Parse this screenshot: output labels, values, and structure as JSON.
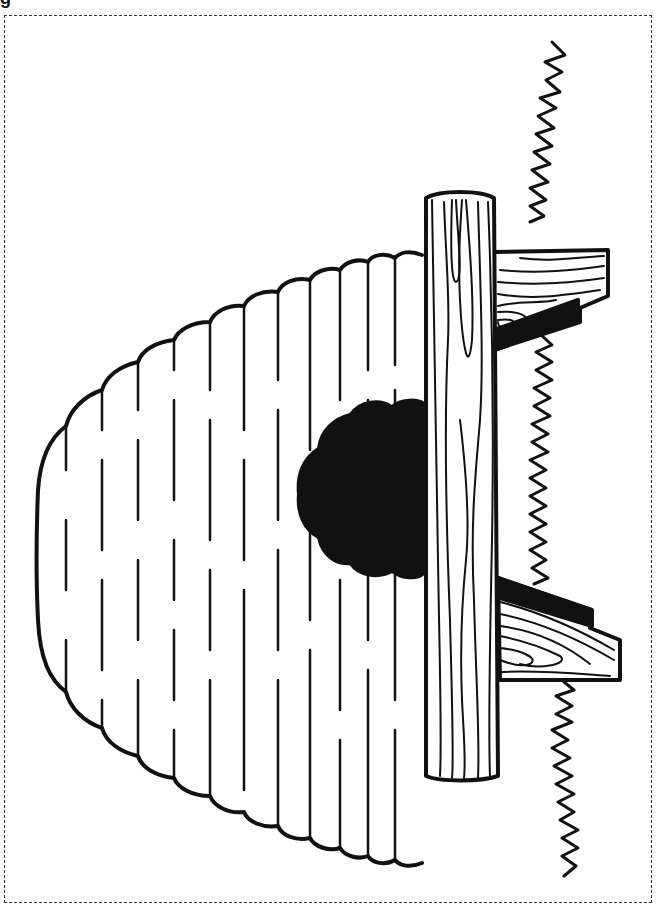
{
  "page": {
    "type": "coloring-page",
    "top_fragment_text": "g",
    "colors": {
      "line": "#111111",
      "fill": "#ffffff",
      "entrance": "#111111",
      "border": "#333333"
    }
  },
  "illustration": {
    "elements": [
      "beehive-skep",
      "hive-entrance",
      "log-beam",
      "wooden-support-left",
      "wooden-support-right",
      "grass-line"
    ]
  }
}
